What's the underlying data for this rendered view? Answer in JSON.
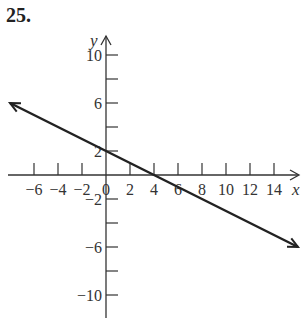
{
  "problem_number": "25.",
  "chart_data": {
    "type": "line",
    "title": "",
    "xlabel": "x",
    "ylabel": "y",
    "x_ticks": [
      -6,
      -4,
      -2,
      0,
      2,
      4,
      6,
      8,
      10,
      12,
      14
    ],
    "x_tick_labels": [
      "−6",
      "−4",
      "−2",
      "0",
      "2",
      "4",
      "6",
      "8",
      "10",
      "12",
      "14"
    ],
    "y_ticks": [
      -10,
      -8,
      -6,
      -4,
      -2,
      2,
      4,
      6,
      8,
      10
    ],
    "y_tick_labels": [
      "−10",
      "",
      "−6",
      "",
      "−2",
      "2",
      "",
      "6",
      "",
      "10"
    ],
    "xlim": [
      -8,
      16
    ],
    "ylim": [
      -12,
      12
    ],
    "grid": false,
    "series": [
      {
        "name": "y = -x/2 + 2",
        "equation": "y = -0.5x + 2",
        "slope": -0.5,
        "intercept": 2,
        "x": [
          -8,
          16
        ],
        "values": [
          6,
          -6
        ],
        "arrows_both_ends": true,
        "color": "#222222"
      }
    ],
    "key_points": [
      {
        "label": "y-intercept",
        "x": 0,
        "y": 2
      },
      {
        "label": "x-intercept",
        "x": 4,
        "y": 0
      }
    ]
  }
}
